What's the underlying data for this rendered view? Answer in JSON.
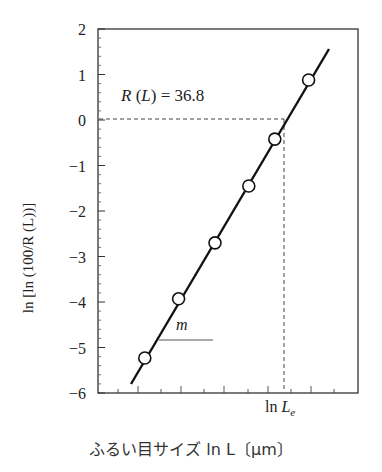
{
  "chart_data": {
    "type": "scatter",
    "title": "",
    "xlabel": "ふるい目サイズ ln L〔μm〕",
    "ylabel": "ln [ln (100/R (L))]",
    "ylim": [
      -6,
      2
    ],
    "y_ticks": [
      "2",
      "1",
      "0",
      "−1",
      "−2",
      "−3",
      "−4",
      "−5",
      "−6"
    ],
    "x_tick_labels": [
      "ln Le"
    ],
    "grid": false,
    "series": [
      {
        "name": "data",
        "marker": "open-circle",
        "x_relative": [
          0.18,
          0.31,
          0.45,
          0.58,
          0.68,
          0.81
        ],
        "values": [
          -5.23,
          -3.93,
          -2.7,
          -1.45,
          -0.42,
          0.88
        ]
      },
      {
        "name": "fit line",
        "marker": "none",
        "values": [
          -5.8,
          1.55
        ]
      }
    ],
    "annotations": [
      {
        "text": "R (L) = 36.8",
        "type": "dashed-reference",
        "y": 0
      },
      {
        "text": "ln Le",
        "type": "dashed-vertical"
      },
      {
        "text": "m",
        "type": "slope-indicator"
      }
    ]
  },
  "labels": {
    "annotation_rl": "R (L) = 36.8",
    "slope": "m",
    "le_prefix": "ln ",
    "le_var": "L",
    "le_sub": "e",
    "xlabel": "ふるい目サイズ ln L〔μm〕",
    "ylabel": "ln [ln (100/R (L))]"
  }
}
